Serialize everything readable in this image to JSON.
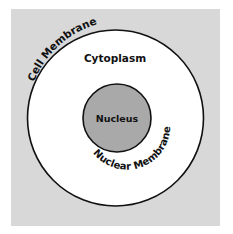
{
  "diagram": {
    "labels": {
      "cell_membrane": "Cell Membrane",
      "cytoplasm": "Cytoplasm",
      "nucleus": "Nucleus",
      "nuclear_membrane": "Nuclear Membrane"
    },
    "colors": {
      "background": "#d8d8d8",
      "cytoplasm": "#ffffff",
      "nucleus": "#a9a9a9",
      "outline": "#111111"
    }
  }
}
